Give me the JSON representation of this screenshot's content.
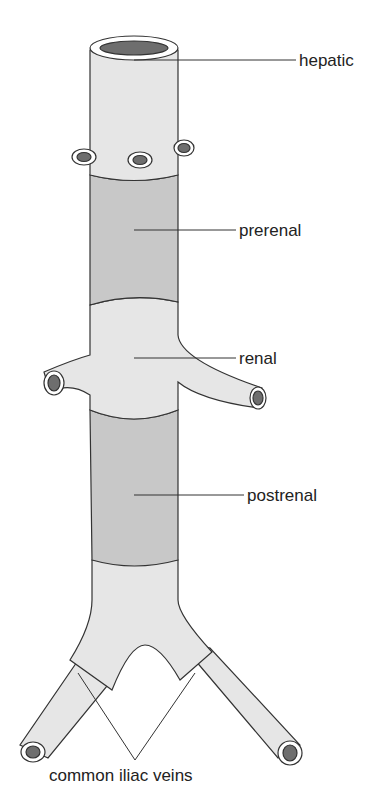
{
  "diagram": {
    "colors": {
      "light_segment": "#e6e6e6",
      "dark_segment": "#c8c8c8",
      "lumen": "#6e6e6e",
      "outline": "#333333",
      "leader": "#333333",
      "text": "#222222"
    },
    "labels": [
      {
        "id": "hepatic",
        "text": "hepatic",
        "x": 299,
        "y": 52
      },
      {
        "id": "prerenal",
        "text": "prerenal",
        "x": 239,
        "y": 222
      },
      {
        "id": "renal",
        "text": "renal",
        "x": 239,
        "y": 352
      },
      {
        "id": "postrenal",
        "text": "postrenal",
        "x": 247,
        "y": 487
      },
      {
        "id": "common-iliac",
        "text": "common iliac veins",
        "x": 49,
        "y": 767
      }
    ]
  }
}
